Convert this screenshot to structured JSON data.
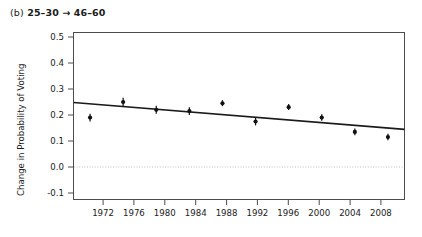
{
  "panel": {
    "tag": "(b)",
    "label": "25–30 → 46–60",
    "full_title": "(b) 25–30 → 46–60"
  },
  "colors": {
    "background": "#ffffff",
    "frame": "#4d4d4d",
    "point": "#111111",
    "trend_line": "#1a1a1a",
    "zero_line": "#bfbfbf",
    "text": "#1a1a1a"
  },
  "chart_data": {
    "type": "scatter",
    "title": "(b) 25–30 → 46–60",
    "xlabel": "",
    "ylabel": "Change in Probability of Voting",
    "x": [
      1972,
      1976,
      1980,
      1984,
      1988,
      1992,
      1996,
      2000,
      2004,
      2008
    ],
    "xtick_labels": [
      "1972",
      "1976",
      "1980",
      "1984",
      "1988",
      "1992",
      "1996",
      "2000",
      "2004",
      "2008"
    ],
    "xlim": [
      1970,
      2010
    ],
    "ylim": [
      -0.13,
      0.52
    ],
    "yticks": [
      0.5,
      0.4,
      0.3,
      0.2,
      0.1,
      0.0,
      -0.1
    ],
    "ytick_labels": [
      "0.5",
      "0.4",
      "0.3",
      "0.2",
      "0.1",
      "0.0",
      "-0.1"
    ],
    "grid": false,
    "legend": "none",
    "series": [
      {
        "name": "Change in Probability of Voting",
        "marker": "point-with-error-bar",
        "values": [
          0.19,
          0.25,
          0.22,
          0.215,
          0.245,
          0.175,
          0.23,
          0.19,
          0.135,
          0.115
        ],
        "error_low": [
          0.175,
          0.233,
          0.205,
          0.2,
          0.234,
          0.16,
          0.219,
          0.178,
          0.122,
          0.103
        ],
        "error_high": [
          0.205,
          0.266,
          0.236,
          0.23,
          0.257,
          0.19,
          0.242,
          0.203,
          0.148,
          0.128
        ]
      },
      {
        "name": "fitted trend line",
        "type": "line",
        "x_endpoints": [
          1970,
          2010
        ],
        "y_endpoints": [
          0.248,
          0.145
        ]
      }
    ],
    "annotations": [
      {
        "name": "zero-reference-line",
        "y": 0.0,
        "style": "dotted"
      }
    ]
  }
}
